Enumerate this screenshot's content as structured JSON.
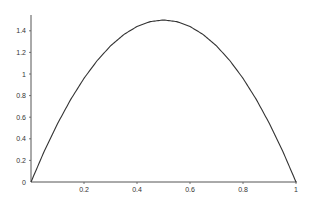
{
  "chart_data": {
    "type": "line",
    "title": "",
    "xlabel": "",
    "ylabel": "",
    "xlim": [
      0,
      1
    ],
    "ylim": [
      0,
      1.55
    ],
    "grid": false,
    "legend": null,
    "x_ticks": [
      "0.2",
      "0.4",
      "0.6",
      "0.8",
      "1"
    ],
    "y_ticks": [
      "0",
      "0.2",
      "0.4",
      "0.6",
      "0.8",
      "1",
      "1.2",
      "1.4"
    ],
    "series": [
      {
        "name": "f(x) = 6x(1-x)",
        "x": [
          0,
          0.05,
          0.1,
          0.15,
          0.2,
          0.25,
          0.3,
          0.35,
          0.4,
          0.45,
          0.5,
          0.55,
          0.6,
          0.65,
          0.7,
          0.75,
          0.8,
          0.85,
          0.9,
          0.95,
          1
        ],
        "y": [
          0,
          0.285,
          0.54,
          0.765,
          0.96,
          1.125,
          1.26,
          1.365,
          1.44,
          1.485,
          1.5,
          1.485,
          1.44,
          1.365,
          1.26,
          1.125,
          0.96,
          0.765,
          0.54,
          0.285,
          0
        ]
      }
    ],
    "colors": {
      "line": "#333333",
      "axis": "#555555",
      "text": "#333333"
    }
  },
  "origin_label": "0"
}
